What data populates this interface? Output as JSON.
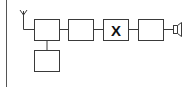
{
  "diagram": {
    "type": "block-diagram",
    "colors": {
      "stroke": "#3a3a3a",
      "background": "#ffffff",
      "border": "#555555"
    },
    "blocks": [
      {
        "id": "block-1",
        "label": ""
      },
      {
        "id": "block-2",
        "label": ""
      },
      {
        "id": "block-3",
        "label": "X"
      },
      {
        "id": "block-4",
        "label": ""
      },
      {
        "id": "block-5",
        "label": ""
      }
    ],
    "components": {
      "antenna": "antenna-icon",
      "speaker": "speaker-icon"
    }
  }
}
